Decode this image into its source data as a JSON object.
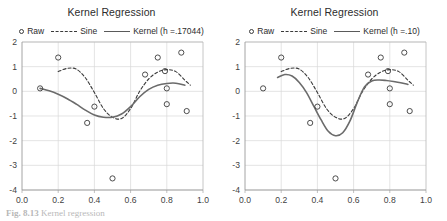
{
  "figure": {
    "caption_label": "Fig. 8.13",
    "caption_text": "Kernel regression"
  },
  "panels": [
    {
      "id": "left",
      "title": "Kernel Regression",
      "legend": [
        {
          "label": "Raw",
          "marker": "circle-outline-icon"
        },
        {
          "label": "Sine",
          "marker": "dashed-line-icon"
        },
        {
          "label": "Kernel (h =.17044)",
          "marker": "solid-line-icon"
        }
      ]
    },
    {
      "id": "right",
      "title": "Kernel Regression",
      "legend": [
        {
          "label": "Raw",
          "marker": "circle-outline-icon"
        },
        {
          "label": "Sine",
          "marker": "dashed-line-icon"
        },
        {
          "label": "Kernel (h =.10)",
          "marker": "solid-line-icon"
        }
      ]
    }
  ],
  "chart_data": [
    {
      "type": "scatter",
      "panel": "left",
      "title": "Kernel Regression",
      "xlabel": "",
      "ylabel": "",
      "xlim": [
        0.0,
        1.0
      ],
      "ylim": [
        -4,
        2
      ],
      "xticks": [
        "0.0",
        "0.2",
        "0.4",
        "0.6",
        "0.8",
        "1.0"
      ],
      "yticks": [
        "2",
        "1",
        "0",
        "-1",
        "-2",
        "-3",
        "-4"
      ],
      "grid": true,
      "legend_position": "top-center",
      "series": [
        {
          "name": "Raw",
          "type": "scatter",
          "marker": "open-circle",
          "x": [
            0.1,
            0.2,
            0.36,
            0.4,
            0.5,
            0.68,
            0.75,
            0.79,
            0.8,
            0.8,
            0.88,
            0.91
          ],
          "y": [
            0.12,
            1.37,
            -1.28,
            -0.62,
            -3.53,
            0.68,
            1.37,
            0.82,
            0.12,
            -0.52,
            1.57,
            -0.8
          ]
        },
        {
          "name": "Sine",
          "type": "line",
          "style": "dashed",
          "x": [
            0.2,
            0.25,
            0.3,
            0.35,
            0.4,
            0.45,
            0.5,
            0.55,
            0.6,
            0.65,
            0.7,
            0.75,
            0.8,
            0.85,
            0.9,
            0.93
          ],
          "y": [
            0.8,
            0.93,
            0.9,
            0.55,
            -0.05,
            -0.7,
            -1.05,
            -1.1,
            -0.7,
            0.0,
            0.5,
            0.78,
            0.88,
            0.8,
            0.45,
            0.25
          ]
        },
        {
          "name": "Kernel (h =.17044)",
          "type": "line",
          "style": "solid",
          "bandwidth": 0.17044,
          "x": [
            0.1,
            0.15,
            0.2,
            0.25,
            0.3,
            0.35,
            0.4,
            0.45,
            0.5,
            0.55,
            0.6,
            0.65,
            0.7,
            0.75,
            0.8,
            0.85,
            0.9
          ],
          "y": [
            0.12,
            0.02,
            -0.12,
            -0.3,
            -0.52,
            -0.76,
            -0.96,
            -1.05,
            -1.05,
            -0.92,
            -0.62,
            -0.22,
            0.08,
            0.25,
            0.32,
            0.33,
            0.25
          ]
        }
      ]
    },
    {
      "type": "scatter",
      "panel": "right",
      "title": "Kernel Regression",
      "xlabel": "",
      "ylabel": "",
      "xlim": [
        0.0,
        1.0
      ],
      "ylim": [
        -4,
        2
      ],
      "xticks": [
        "0.0",
        "0.2",
        "0.4",
        "0.6",
        "0.8",
        "1.0"
      ],
      "yticks": [
        "2",
        "1",
        "0",
        "-1",
        "-2",
        "-3",
        "-4"
      ],
      "grid": true,
      "legend_position": "top-center",
      "series": [
        {
          "name": "Raw",
          "type": "scatter",
          "marker": "open-circle",
          "x": [
            0.1,
            0.2,
            0.36,
            0.4,
            0.5,
            0.68,
            0.75,
            0.79,
            0.8,
            0.8,
            0.88,
            0.91
          ],
          "y": [
            0.12,
            1.37,
            -1.28,
            -0.62,
            -3.53,
            0.68,
            1.37,
            0.82,
            0.12,
            -0.52,
            1.57,
            -0.8
          ]
        },
        {
          "name": "Sine",
          "type": "line",
          "style": "dashed",
          "x": [
            0.2,
            0.25,
            0.3,
            0.35,
            0.4,
            0.45,
            0.5,
            0.55,
            0.6,
            0.65,
            0.7,
            0.75,
            0.8,
            0.85,
            0.9,
            0.93
          ],
          "y": [
            0.8,
            0.93,
            0.9,
            0.55,
            -0.05,
            -0.7,
            -1.05,
            -1.1,
            -0.7,
            0.0,
            0.5,
            0.78,
            0.88,
            0.8,
            0.45,
            0.25
          ]
        },
        {
          "name": "Kernel (h =.10)",
          "type": "line",
          "style": "solid",
          "bandwidth": 0.1,
          "x": [
            0.18,
            0.22,
            0.26,
            0.3,
            0.34,
            0.38,
            0.42,
            0.46,
            0.5,
            0.54,
            0.58,
            0.62,
            0.66,
            0.7,
            0.74,
            0.78,
            0.82,
            0.86,
            0.9
          ],
          "y": [
            0.56,
            0.68,
            0.62,
            0.36,
            -0.05,
            -0.6,
            -1.15,
            -1.62,
            -1.8,
            -1.68,
            -1.2,
            -0.45,
            0.18,
            0.42,
            0.46,
            0.44,
            0.4,
            0.35,
            0.28
          ]
        }
      ]
    }
  ]
}
